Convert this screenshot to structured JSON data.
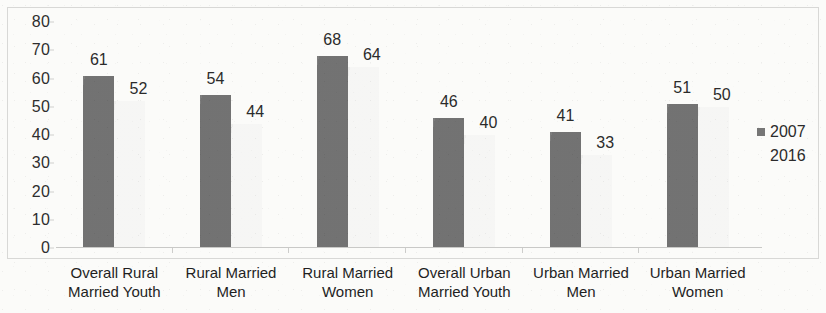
{
  "chart_data": {
    "type": "bar",
    "title": "",
    "subtitle": "",
    "xlabel": "",
    "ylabel": "",
    "ylim": [
      0,
      80
    ],
    "y_ticks": [
      0,
      10,
      20,
      30,
      40,
      50,
      60,
      70,
      80
    ],
    "grid": false,
    "legend_position": "right",
    "categories": [
      "Overall Rural Married Youth",
      "Rural Married Men",
      "Rural Married Women",
      "Overall Urban Married Youth",
      "Urban Married Men",
      "Urban Married Women"
    ],
    "category_label_lines": [
      [
        "Overall Rural",
        "Married Youth"
      ],
      [
        "Rural Married",
        "Men"
      ],
      [
        "Rural Married",
        "Women"
      ],
      [
        "Overall Urban",
        "Married Youth"
      ],
      [
        "Urban Married",
        "Men"
      ],
      [
        "Urban Married",
        "Women"
      ]
    ],
    "series": [
      {
        "name": "2007",
        "color": "#767676",
        "values": [
          61,
          54,
          68,
          46,
          41,
          51
        ]
      },
      {
        "name": "2016",
        "color": "#f2f2f0",
        "values": [
          52,
          44,
          64,
          40,
          33,
          50
        ]
      }
    ]
  },
  "legend": {
    "items": [
      {
        "label": "2007",
        "swatch_color": "#767676"
      },
      {
        "label": "2016",
        "swatch_color": "#fafaf8"
      }
    ]
  }
}
